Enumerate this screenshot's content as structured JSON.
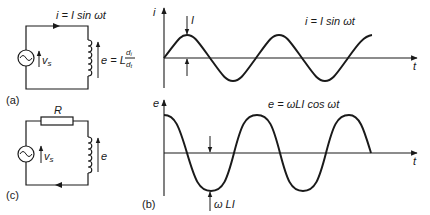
{
  "figure": {
    "panel_a": {
      "label": "(a)",
      "current_label": "i = I sin ωt",
      "source_label": "v",
      "source_sub": "s",
      "emf_label_prefix": "e = L",
      "emf_frac_num": "d",
      "emf_frac_num_sub": "i",
      "emf_frac_den": "d",
      "emf_frac_den_sub": "t"
    },
    "panel_c": {
      "label": "(c)",
      "resistor_label": "R",
      "source_label": "v",
      "source_sub": "s",
      "emf_label": "e"
    },
    "panel_b": {
      "label": "(b)",
      "top_graph": {
        "y_axis_label": "i",
        "x_axis_label": "t",
        "equation": "i = I sin ωt",
        "amplitude_label": "I"
      },
      "bottom_graph": {
        "y_axis_label": "e",
        "x_axis_label": "t",
        "equation": "e = ωLI cos ωt",
        "amplitude_label": "ω LI"
      }
    },
    "colors": {
      "ink": "#1a1a1a",
      "background": "#ffffff"
    }
  }
}
